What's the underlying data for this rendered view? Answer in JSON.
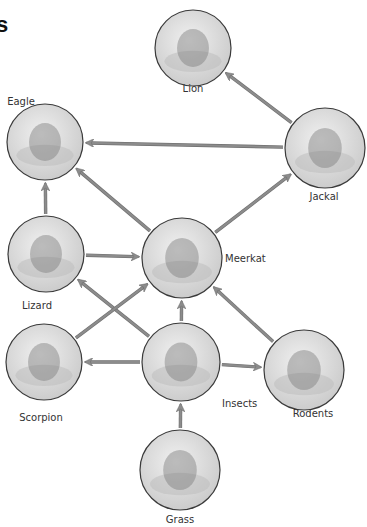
{
  "diagram": {
    "type": "food-web",
    "title_fragment": "s",
    "colors": {
      "arrow": "#8c8c8c",
      "arrow_edge": "#6e6e6e",
      "circle_fill": "#dcdcdc",
      "circle_stroke": "#3a3a3a",
      "label": "#333333"
    },
    "nodes": [
      {
        "id": "lion",
        "label": "Lion",
        "cx": 193,
        "cy": 48,
        "r": 38,
        "lx": 193,
        "ly": 88,
        "align": "center"
      },
      {
        "id": "eagle",
        "label": "Eagle",
        "cx": 45,
        "cy": 142,
        "r": 38,
        "lx": 21,
        "ly": 101,
        "align": "center"
      },
      {
        "id": "jackal",
        "label": "Jackal",
        "cx": 325,
        "cy": 148,
        "r": 40,
        "lx": 324,
        "ly": 196,
        "align": "center"
      },
      {
        "id": "lizard",
        "label": "Lizard",
        "cx": 46,
        "cy": 254,
        "r": 38,
        "lx": 37,
        "ly": 305,
        "align": "center"
      },
      {
        "id": "meerkat",
        "label": "Meerkat",
        "cx": 182,
        "cy": 258,
        "r": 40,
        "lx": 225,
        "ly": 258,
        "align": "left"
      },
      {
        "id": "scorpion",
        "label": "Scorpion",
        "cx": 44,
        "cy": 362,
        "r": 38,
        "lx": 41,
        "ly": 417,
        "align": "center"
      },
      {
        "id": "insects",
        "label": "Insects",
        "cx": 181,
        "cy": 362,
        "r": 39,
        "lx": 222,
        "ly": 403,
        "align": "left"
      },
      {
        "id": "rodents",
        "label": "Rodents",
        "cx": 304,
        "cy": 370,
        "r": 40,
        "lx": 313,
        "ly": 413,
        "align": "center"
      },
      {
        "id": "grass",
        "label": "Grass",
        "cx": 180,
        "cy": 470,
        "r": 40,
        "lx": 180,
        "ly": 519,
        "align": "center"
      }
    ],
    "edges": [
      {
        "from": "jackal",
        "to": "lion"
      },
      {
        "from": "jackal",
        "to": "eagle"
      },
      {
        "from": "meerkat",
        "to": "eagle"
      },
      {
        "from": "lizard",
        "to": "eagle"
      },
      {
        "from": "meerkat",
        "to": "jackal"
      },
      {
        "from": "lizard",
        "to": "meerkat"
      },
      {
        "from": "insects",
        "to": "lizard"
      },
      {
        "from": "scorpion",
        "to": "meerkat"
      },
      {
        "from": "insects",
        "to": "meerkat"
      },
      {
        "from": "rodents",
        "to": "meerkat"
      },
      {
        "from": "insects",
        "to": "scorpion"
      },
      {
        "from": "insects",
        "to": "rodents"
      },
      {
        "from": "grass",
        "to": "insects"
      }
    ]
  }
}
